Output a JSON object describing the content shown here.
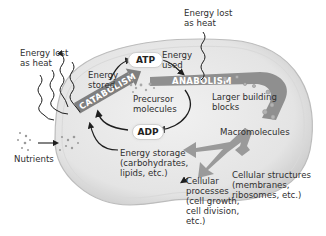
{
  "diagram": {
    "type": "cellular-metabolism",
    "labels": {
      "heat_left": "Energy lost\nas heat",
      "heat_top": "Energy lost\nas heat",
      "energy_stored": "Energy\nstored",
      "energy_used": "Energy\nused",
      "atp": "ATP",
      "adp": "ADP",
      "catabolism": "CATABOLISM",
      "anabolism": "ANABOLISM",
      "precursor": "Precursor\nmolecules",
      "larger_blocks": "Larger building\nblocks",
      "macromolecules": "Macromolecules",
      "nutrients": "Nutrients",
      "energy_storage": "Energy storage\n(carbohydrates,\nlipids, etc.)",
      "cellular_processes": "Cellular\nprocesses\n(cell growth,\ncell division,\netc.)",
      "cellular_structures": "Cellular structures\n(membranes,\nribosomes, etc.)"
    },
    "colors": {
      "cell_fill": "#e9e9e9",
      "cell_rim": "#c4c4c4",
      "band": "#8a8a8a",
      "arrow_dark": "#1e1e1e",
      "wide_arrow": "#9a9a9a"
    }
  }
}
